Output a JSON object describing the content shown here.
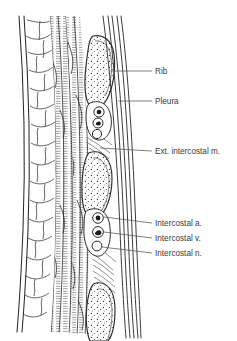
{
  "figure": {
    "background_color": "#ffffff",
    "ink_color": "#2b2b2b",
    "label_color": "#3b3b3b"
  },
  "labels": [
    {
      "id": "rib",
      "text": "Rib",
      "x": 155,
      "y": 71,
      "leader_x1": 112,
      "leader_y1": 71,
      "leader_x2": 152,
      "leader_y2": 71
    },
    {
      "id": "pleura",
      "text": "Pleura",
      "x": 155,
      "y": 101,
      "leader_x1": 118,
      "leader_y1": 101,
      "leader_x2": 152,
      "leader_y2": 101
    },
    {
      "id": "ext-intercostal",
      "text": "Ext. intercostal m.",
      "x": 155,
      "y": 151,
      "leader_x1": 100,
      "leader_y1": 148,
      "leader_x2": 152,
      "leader_y2": 151
    },
    {
      "id": "intercostal-a",
      "text": "Intercostal a.",
      "x": 155,
      "y": 225,
      "leader_x1": 107,
      "leader_y1": 217,
      "leader_x2": 152,
      "leader_y2": 225
    },
    {
      "id": "intercostal-v",
      "text": "Intercostal v.",
      "x": 155,
      "y": 240,
      "leader_x1": 108,
      "leader_y1": 231,
      "leader_x2": 152,
      "leader_y2": 240
    },
    {
      "id": "intercostal-n",
      "text": "Intercostal n.",
      "x": 155,
      "y": 255,
      "leader_x1": 108,
      "leader_y1": 247,
      "leader_x2": 152,
      "leader_y2": 255
    }
  ],
  "structures": {
    "skin_layer": "skin",
    "fat_layer": "subcutaneous fat lobules",
    "muscle_layer": "hatched intercostal muscle bands",
    "ribs": [
      {
        "id": "rib-upper",
        "cy": 75
      },
      {
        "id": "rib-middle",
        "cy": 185
      },
      {
        "id": "rib-lower",
        "cy": 305
      }
    ],
    "neurovascular_bundles": [
      {
        "id": "bundle-upper",
        "artery_cy": 112,
        "vein_cy": 122,
        "nerve_cy": 132
      },
      {
        "id": "bundle-middle",
        "artery_cy": 219,
        "vein_cy": 232,
        "nerve_cy": 246
      }
    ],
    "pleura_lines": 5
  }
}
